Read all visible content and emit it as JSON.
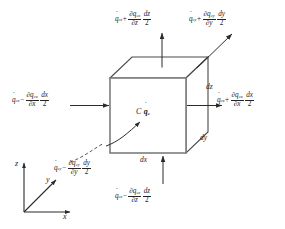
{
  "figure": {
    "type": "schematic-diagram",
    "background": "#ffffff",
    "line_color": "#4a4a4a",
    "text_color": "#242424"
  },
  "cube": {
    "front_face": {
      "left": 110,
      "top": 78,
      "right": 186,
      "bottom": 153
    },
    "depth_offset": {
      "dx": 22,
      "dy": -21
    },
    "edge_labels": [
      {
        "name": "dx",
        "text": "dx",
        "x": 140,
        "y": 158
      },
      {
        "name": "dy",
        "text": "dy",
        "x": 200,
        "y": 137
      },
      {
        "name": "dz",
        "text": "dz",
        "x": 206,
        "y": 86
      }
    ]
  },
  "center": {
    "point_label": "C",
    "source_symbol": "q",
    "source_subscript": "c"
  },
  "axes": {
    "origin": {
      "x": 24,
      "y": 212
    },
    "labels": [
      {
        "name": "z-axis-label",
        "text": "z",
        "x": 16,
        "y": 163
      },
      {
        "name": "y-axis-label",
        "text": "y",
        "x": 45,
        "y": 180
      },
      {
        "name": "x-axis-label",
        "text": "x",
        "x": 63,
        "y": 217
      }
    ]
  },
  "flux_terms": [
    {
      "id": "top",
      "name": "heat-flux-z-out",
      "base": "q",
      "base_sub": "cz",
      "sign": "+",
      "num_partial": "∂q",
      "num_sub": "cz",
      "den_partial": "∂z",
      "diff_num": "dz",
      "diff_den": "2",
      "x": 115,
      "y": 11
    },
    {
      "id": "top-right",
      "name": "heat-flux-y-out",
      "base": "q",
      "base_sub": "cy",
      "sign": "+",
      "num_partial": "∂q",
      "num_sub": "cy",
      "den_partial": "∂y",
      "diff_num": "dy",
      "diff_den": "2",
      "x": 189,
      "y": 11
    },
    {
      "id": "left",
      "name": "heat-flux-x-in",
      "base": "q",
      "base_sub": "cx",
      "sign": "−",
      "num_partial": "∂q",
      "num_sub": "cx",
      "den_partial": "∂x",
      "diff_num": "dx",
      "diff_den": "2",
      "x": 12,
      "y": 92
    },
    {
      "id": "right",
      "name": "heat-flux-x-out",
      "base": "q",
      "base_sub": "cx",
      "sign": "+",
      "num_partial": "∂q",
      "num_sub": "cx",
      "den_partial": "∂x",
      "diff_num": "dx",
      "diff_den": "2",
      "x": 217,
      "y": 92
    },
    {
      "id": "bottom-left",
      "name": "heat-flux-y-in",
      "base": "q",
      "base_sub": "cy",
      "sign": "−",
      "num_partial": "∂q",
      "num_sub": "cy",
      "den_partial": "∂y",
      "diff_num": "dy",
      "diff_den": "2",
      "x": 54,
      "y": 160
    },
    {
      "id": "bottom",
      "name": "heat-flux-z-in",
      "base": "q",
      "base_sub": "cz",
      "sign": "−",
      "num_partial": "∂q",
      "num_sub": "cz",
      "den_partial": "∂z",
      "diff_num": "dz",
      "diff_den": "2",
      "x": 115,
      "y": 188
    }
  ]
}
